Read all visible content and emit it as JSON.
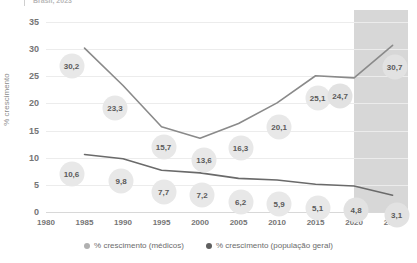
{
  "header": {
    "caption": "Brasil, 2023"
  },
  "legend": {
    "items": [
      {
        "label": "% crescimento (médicos)",
        "color": "#b0b0b0"
      },
      {
        "label": "% crescimento (população geral)",
        "color": "#5f5f5f"
      }
    ]
  },
  "colors": {
    "line_medicos": "#8a8a8a",
    "line_populacao": "#6a6a6a",
    "bubble_fill": "#e8e8e8",
    "bubble_text": "#5a5a5a",
    "grid": "#ececec",
    "shade_band": "#d4d4d4",
    "axis_text": "#757575"
  },
  "chart_data": {
    "type": "line",
    "title": "",
    "subtitle": "Brasil, 2023",
    "xlabel": "",
    "ylabel": "% crescimento",
    "xlim": [
      1980,
      2027
    ],
    "ylim": [
      0,
      35
    ],
    "yticks": [
      0,
      5,
      10,
      15,
      20,
      25,
      30,
      35
    ],
    "xticks": [
      1980,
      1985,
      1990,
      1995,
      2000,
      2005,
      2010,
      2015,
      2020,
      2025
    ],
    "grid": true,
    "legend_position": "bottom",
    "projection_band": {
      "start": 2020,
      "end": 2027,
      "label": ""
    },
    "x": [
      1985,
      1990,
      1995,
      2000,
      2005,
      2010,
      2015,
      2020,
      2025
    ],
    "series": [
      {
        "name": "% crescimento (médicos)",
        "values": [
          30.2,
          23.3,
          15.7,
          13.6,
          16.3,
          20.1,
          25.1,
          24.7,
          30.7
        ],
        "labels": [
          "30,2",
          "23,3",
          "15,7",
          "13,6",
          "16,3",
          "20,1",
          "25,1",
          "24,7",
          "30,7"
        ]
      },
      {
        "name": "% crescimento (população geral)",
        "values": [
          10.6,
          9.8,
          7.7,
          7.2,
          6.2,
          5.9,
          5.1,
          4.8,
          3.1
        ],
        "labels": [
          "10,6",
          "9,8",
          "7,7",
          "7,2",
          "6,2",
          "5,9",
          "5,1",
          "4,8",
          "3,1"
        ]
      }
    ]
  }
}
